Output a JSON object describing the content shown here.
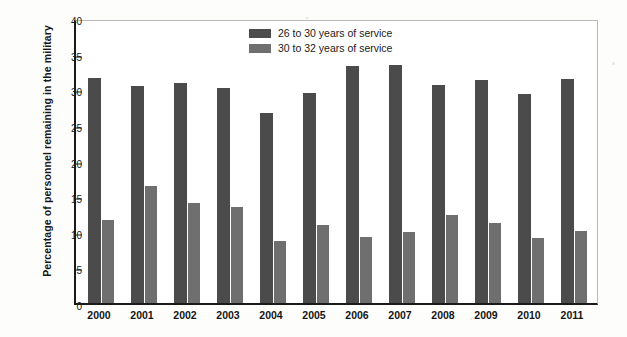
{
  "chart_data": {
    "type": "bar",
    "title": "",
    "xlabel": "",
    "ylabel": "Percentage of personnel remaining in the military",
    "ylim": [
      0,
      40
    ],
    "ytick_step": 5,
    "yticks": [
      "40",
      "35",
      "30",
      "25",
      "20",
      "15",
      "10",
      "5",
      "0"
    ],
    "grid": false,
    "legend_position": "top-center",
    "categories": [
      "2000",
      "2001",
      "2002",
      "2003",
      "2004",
      "2005",
      "2006",
      "2007",
      "2008",
      "2009",
      "2010",
      "2011"
    ],
    "series": [
      {
        "name": "26 to 30 years of service",
        "color": "#4b4b4b",
        "values": [
          31.6,
          30.4,
          30.9,
          30.2,
          26.7,
          29.5,
          33.3,
          33.4,
          30.6,
          31.3,
          29.4,
          31.4
        ]
      },
      {
        "name": "30 to 32 years of service",
        "color": "#6f6f6f",
        "values": [
          11.6,
          16.4,
          14.0,
          13.5,
          8.7,
          10.9,
          9.2,
          10.0,
          12.4,
          11.3,
          9.1,
          10.1
        ]
      }
    ]
  },
  "axis": {
    "y_title": "Percentage of personnel remaining in the military"
  },
  "legend": {
    "items": [
      {
        "label": "26 to 30 years of service",
        "color": "#4b4b4b"
      },
      {
        "label": "30 to 32 years of service",
        "color": "#6f6f6f"
      }
    ]
  }
}
